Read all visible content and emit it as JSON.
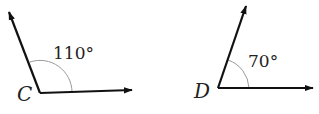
{
  "angles": [
    {
      "vertex_label": "C",
      "measure_label": "110°",
      "measure": 110
    },
    {
      "vertex_label": "D",
      "measure_label": "70°",
      "measure": 70
    }
  ],
  "colors": {
    "ray": "#111111",
    "arc": "#9a9a9a",
    "text": "#222222"
  }
}
